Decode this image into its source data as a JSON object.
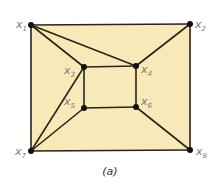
{
  "colors": {
    "fill": "#f8eab8",
    "edge": "#2a2418",
    "node": "#111111",
    "label": "#7a7a7a"
  },
  "caption": "(a)",
  "graph": {
    "nodes": [
      {
        "id": "x1",
        "label": "x",
        "sub": "1",
        "x": 31,
        "y": 25
      },
      {
        "id": "x2",
        "label": "x",
        "sub": "2",
        "x": 190,
        "y": 24
      },
      {
        "id": "x3",
        "label": "x",
        "sub": "3",
        "x": 84,
        "y": 67
      },
      {
        "id": "x4",
        "label": "x",
        "sub": "4",
        "x": 136,
        "y": 66
      },
      {
        "id": "x5",
        "label": "x",
        "sub": "5",
        "x": 84,
        "y": 108
      },
      {
        "id": "x6",
        "label": "x",
        "sub": "6",
        "x": 136,
        "y": 107
      },
      {
        "id": "x7",
        "label": "x",
        "sub": "7",
        "x": 31,
        "y": 151
      },
      {
        "id": "x8",
        "label": "x",
        "sub": "8",
        "x": 190,
        "y": 150
      }
    ],
    "edges": [
      [
        "x1",
        "x2"
      ],
      [
        "x2",
        "x8"
      ],
      [
        "x8",
        "x7"
      ],
      [
        "x7",
        "x1"
      ],
      [
        "x3",
        "x4"
      ],
      [
        "x4",
        "x6"
      ],
      [
        "x6",
        "x5"
      ],
      [
        "x5",
        "x3"
      ],
      [
        "x1",
        "x3"
      ],
      [
        "x1",
        "x4"
      ],
      [
        "x2",
        "x4"
      ],
      [
        "x6",
        "x8"
      ],
      [
        "x7",
        "x3"
      ],
      [
        "x7",
        "x5"
      ]
    ]
  },
  "labels": {
    "x1": {
      "text": "x",
      "sub": "1"
    },
    "x2": {
      "text": "x",
      "sub": "2"
    },
    "x3": {
      "text": "x",
      "sub": "3"
    },
    "x4": {
      "text": "x",
      "sub": "4"
    },
    "x5": {
      "text": "x",
      "sub": "5"
    },
    "x6": {
      "text": "x",
      "sub": "6"
    },
    "x7": {
      "text": "x",
      "sub": "7"
    },
    "x8": {
      "text": "x",
      "sub": "8"
    }
  }
}
